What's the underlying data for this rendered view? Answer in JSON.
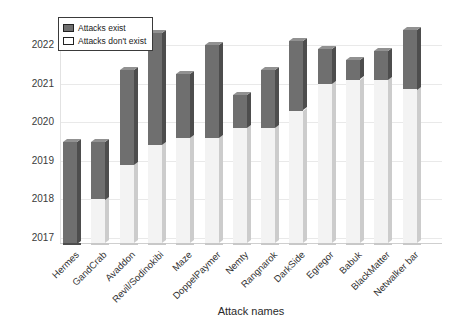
{
  "chart_data": {
    "type": "bar",
    "title": "",
    "xlabel": "Attack names",
    "ylabel": "",
    "yticks": [
      2017,
      2018,
      2019,
      2020,
      2021,
      2022
    ],
    "ylim": [
      2016.8,
      2022.6
    ],
    "grid": "horizontal",
    "legend_position": "top-left",
    "legend": [
      {
        "label": "Attacks exist",
        "fill": "dark"
      },
      {
        "label": "Attacks don't exist",
        "fill": "light"
      }
    ],
    "categories": [
      "Hermes",
      "GandCrab",
      "Avaddon",
      "Revil/Sodinokibi",
      "Maze",
      "DoppelPaymer",
      "Nemty",
      "Rangnarok",
      "DarkSide",
      "Egregor",
      "Babuk",
      "BlackMatter",
      "Netwalker bar"
    ],
    "note": "Each column spans from the axis baseline (2016.8) upward; the light segment marks years with no attacks, the dark segment marks years when attacks exist.",
    "bars": [
      {
        "name": "Hermes",
        "dark_start": 2016.8,
        "dark_end": 2019.5
      },
      {
        "name": "GandCrab",
        "dark_start": 2018.0,
        "dark_end": 2019.5
      },
      {
        "name": "Avaddon",
        "dark_start": 2018.9,
        "dark_end": 2021.35
      },
      {
        "name": "Revil/Sodinokibi",
        "dark_start": 2019.4,
        "dark_end": 2022.3
      },
      {
        "name": "Maze",
        "dark_start": 2019.6,
        "dark_end": 2021.25
      },
      {
        "name": "DoppelPaymer",
        "dark_start": 2019.6,
        "dark_end": 2022.0
      },
      {
        "name": "Nemty",
        "dark_start": 2019.85,
        "dark_end": 2020.7
      },
      {
        "name": "Rangnarok",
        "dark_start": 2019.85,
        "dark_end": 2021.35
      },
      {
        "name": "DarkSide",
        "dark_start": 2020.3,
        "dark_end": 2022.1
      },
      {
        "name": "Egregor",
        "dark_start": 2021.0,
        "dark_end": 2021.9
      },
      {
        "name": "Babuk",
        "dark_start": 2021.1,
        "dark_end": 2021.6
      },
      {
        "name": "BlackMatter",
        "dark_start": 2021.1,
        "dark_end": 2021.85
      },
      {
        "name": "Netwalker bar",
        "dark_start": 2020.85,
        "dark_end": 2022.4
      }
    ],
    "colors": {
      "dark_front": "#6f6f6f",
      "dark_side": "#4d4d4d",
      "dark_top": "#919191",
      "light_front": "#f3f3f3",
      "light_side": "#cccccc",
      "gridline": "#e9e9e9",
      "axis": "#cfcfcf",
      "text": "#333333",
      "background": "#ffffff"
    }
  }
}
